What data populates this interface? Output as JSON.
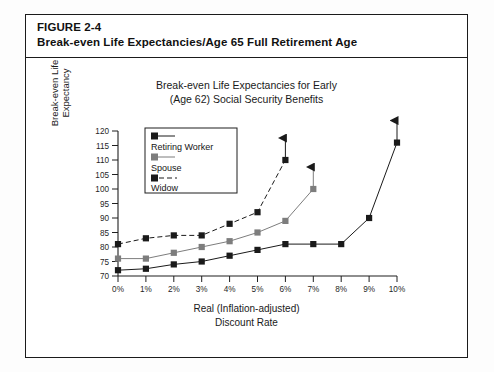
{
  "figure": {
    "label": "FIGURE 2-4",
    "caption": "Break-even Life Expectancies/Age 65 Full Retirement Age"
  },
  "chart_title_line1": "Break-even Life Expectancies for Early",
  "chart_title_line2": "(Age 62) Social Security Benefits",
  "axis": {
    "y_title_line1": "Break-even Life",
    "y_title_line2": "Expectancy",
    "x_title_line1": "Real (Inflation-adjusted)",
    "x_title_line2": "Discount Rate"
  },
  "legend": {
    "items": [
      {
        "label": "Retiring Worker",
        "marker": "black-square",
        "line": "solid",
        "color": "#1a1a1a"
      },
      {
        "label": "Spouse",
        "marker": "gray-square",
        "line": "solid",
        "color": "#7d7d7d"
      },
      {
        "label": "Widow",
        "marker": "black-square",
        "line": "dashed",
        "color": "#1a1a1a"
      }
    ]
  },
  "chart_data": {
    "type": "line",
    "title": "Break-even Life Expectancies for Early (Age 62) Social Security Benefits",
    "xlabel": "Real (Inflation-adjusted) Discount Rate",
    "ylabel": "Break-even Life Expectancy",
    "x": [
      0,
      1,
      2,
      3,
      4,
      5,
      6,
      7,
      8,
      9,
      10
    ],
    "xtick_labels": [
      "0%",
      "1%",
      "2%",
      "3%",
      "4%",
      "5%",
      "6%",
      "7%",
      "8%",
      "9%",
      "10%"
    ],
    "ytick_labels": [
      "70",
      "75",
      "80",
      "85",
      "90",
      "95",
      "100",
      "105",
      "110",
      "115",
      "120"
    ],
    "xlim": [
      0,
      10
    ],
    "ylim": [
      70,
      120
    ],
    "grid": false,
    "legend_position": "inside-upper-left",
    "series": [
      {
        "name": "Retiring Worker",
        "marker": "black-square",
        "line": "solid",
        "color": "#1a1a1a",
        "x": [
          0,
          1,
          2,
          3,
          4,
          5,
          6,
          7,
          8,
          9,
          10
        ],
        "values": [
          72,
          72.5,
          74,
          75,
          77,
          79,
          81,
          81,
          81,
          90,
          116
        ],
        "arrow_end": true,
        "arrow_note": "series continues above 120 beyond 10%"
      },
      {
        "name": "Spouse",
        "marker": "gray-square",
        "line": "solid",
        "color": "#7d7d7d",
        "x": [
          0,
          1,
          2,
          3,
          4,
          5,
          6,
          7
        ],
        "values": [
          76,
          76,
          78,
          80,
          82,
          85,
          89,
          100
        ],
        "arrow_end": true,
        "arrow_note": "series continues above 120 past 7%"
      },
      {
        "name": "Widow",
        "marker": "black-square",
        "line": "dashed",
        "color": "#1a1a1a",
        "x": [
          0,
          1,
          2,
          3,
          4,
          5,
          6
        ],
        "values": [
          81,
          83,
          84,
          84,
          88,
          92,
          110
        ],
        "arrow_end": true,
        "arrow_note": "series continues above 120 past 6%"
      }
    ]
  }
}
